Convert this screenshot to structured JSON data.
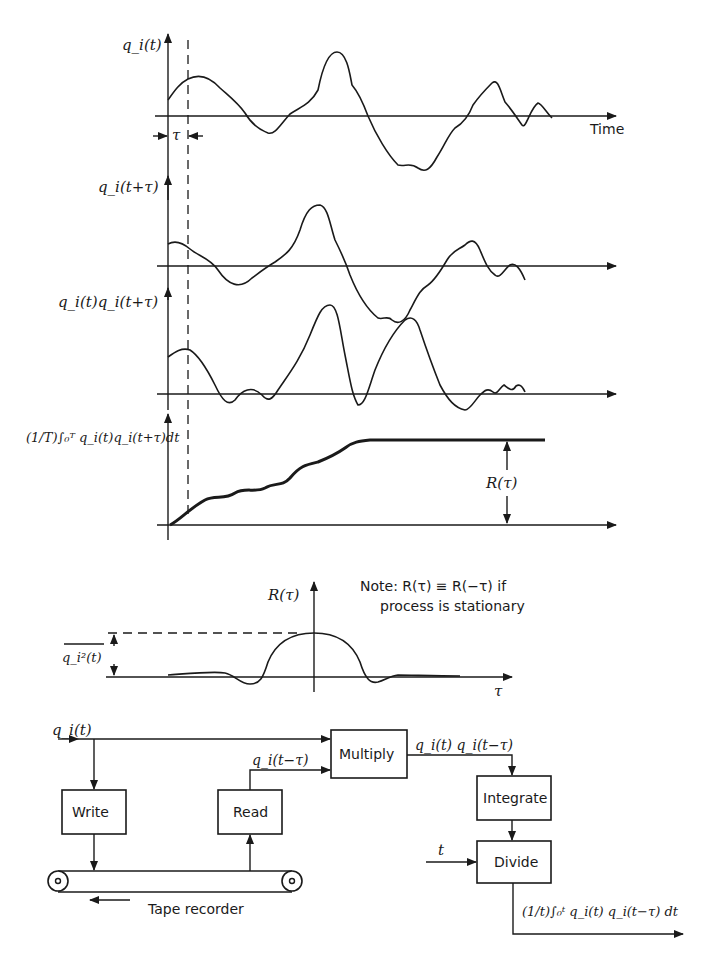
{
  "panels": {
    "signal": {
      "ylabel": "q_i(t)",
      "xlabel": "Time",
      "tau_marker": "τ"
    },
    "shifted": {
      "ylabel": "q_i(t+τ)"
    },
    "product": {
      "ylabel": "q_i(t)q_i(t+τ)"
    },
    "integral": {
      "ylabel": "(1/T)∫₀ᵀ q_i(t)q_i(t+τ)dt",
      "result_label": "R(τ)"
    }
  },
  "autocorrelation": {
    "ylabel": "R(τ)",
    "xlabel": "τ",
    "mean_square_label": "q_i²(t)",
    "note_line1": "Note: R(τ) ≡ R(−τ) if",
    "note_line2": "process is stationary"
  },
  "block_diagram": {
    "input_label": "q_i(t)",
    "write": "Write",
    "read": "Read",
    "read_output_label": "q_i(t−τ)",
    "multiply": "Multiply",
    "multiply_output_label": "q_i(t) q_i(t−τ)",
    "integrate": "Integrate",
    "divide": "Divide",
    "divide_input_label": "t",
    "output_label": "(1/t)∫₀ᵗ q_i(t) q_i(t−τ) dt",
    "tape_label": "Tape recorder"
  }
}
